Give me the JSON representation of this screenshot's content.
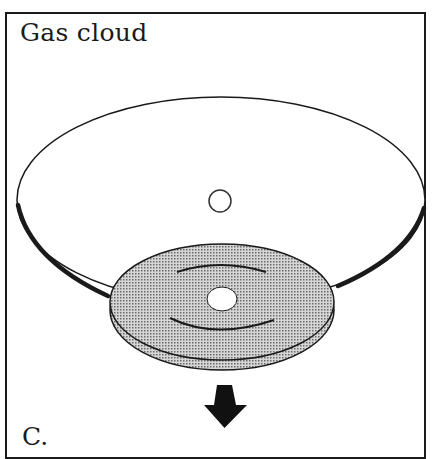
{
  "figure": {
    "title": "Gas cloud",
    "panel_label": "C.",
    "elements": {
      "gas_cloud_ellipse": "large flattened gas cloud outline",
      "central_core": "small open circle at cloud center",
      "disk": "shaded rotating disk with central hole and spiral arcs",
      "arrow": "downward arrow indicating collapse direction"
    },
    "colors": {
      "ink": "#1a1a1a",
      "disk_fill": "#bdbdbd",
      "background": "#ffffff"
    }
  }
}
